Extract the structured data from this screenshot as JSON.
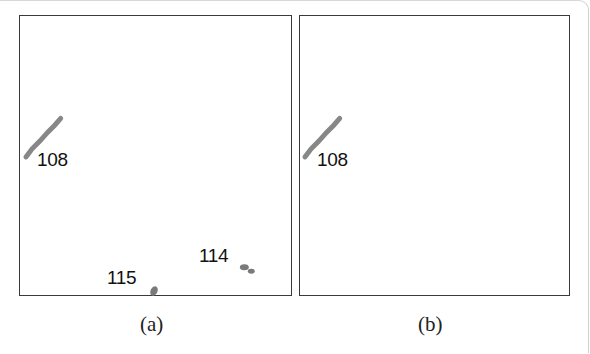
{
  "figure": {
    "panels": [
      {
        "id": "a",
        "caption": "(a)",
        "tracks": [
          {
            "label": "108",
            "color": "#7a7a7a"
          },
          {
            "label": "115",
            "color": "#7a7a7a"
          },
          {
            "label": "114",
            "color": "#7a7a7a"
          }
        ]
      },
      {
        "id": "b",
        "caption": "(b)",
        "tracks": [
          {
            "label": "108",
            "color": "#7a7a7a"
          }
        ]
      }
    ],
    "colors": {
      "border": "#3a3a3a",
      "track": "#7a7a7a",
      "text": "#111111",
      "background": "#ffffff"
    }
  }
}
